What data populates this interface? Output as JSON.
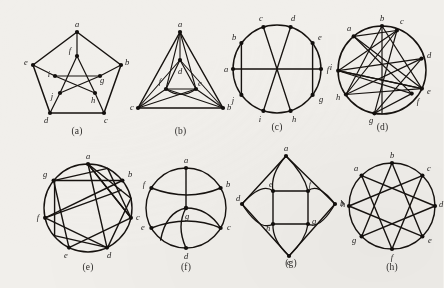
{
  "figure": {
    "background_color": "#f1efeb",
    "ink_color": "#16120f",
    "panel_count": 8
  },
  "captions": {
    "a": "(a)",
    "b": "(b)",
    "c": "(c)",
    "d": "(d)",
    "e": "(e)",
    "f": "(f)",
    "g": "(g)",
    "h": "(h)"
  },
  "panels": [
    {
      "id": "a",
      "caption": "(a)",
      "layout": "pentagon-with-inner-pentagram",
      "vertex_labels": [
        "a",
        "b",
        "c",
        "d",
        "e",
        "f",
        "g",
        "h",
        "i",
        "j"
      ],
      "outer_labels": [
        "a",
        "b",
        "c",
        "d",
        "e"
      ],
      "inner_labels": [
        "f",
        "g",
        "h",
        "i",
        "j"
      ],
      "labels": {
        "a": "a",
        "b": "b",
        "c": "c",
        "d": "d",
        "e": "e",
        "f": "f",
        "g": "g",
        "h": "h",
        "i": "i",
        "j": "j"
      }
    },
    {
      "id": "b",
      "caption": "(b)",
      "layout": "triangle-with-nested-triangle",
      "vertex_labels": [
        "a",
        "b",
        "c",
        "d",
        "e",
        "f"
      ],
      "labels": {
        "a": "a",
        "b": "b",
        "c": "c",
        "d": "d",
        "e": "e",
        "f": "f"
      }
    },
    {
      "id": "c",
      "caption": "(c)",
      "layout": "circle-10-with-chords",
      "vertex_labels": [
        "a",
        "b",
        "c",
        "d",
        "e",
        "f",
        "g",
        "h",
        "i",
        "j"
      ],
      "chords": [
        [
          "a",
          "f"
        ],
        [
          "b",
          "j"
        ],
        [
          "e",
          "g"
        ],
        [
          "c",
          "h"
        ],
        [
          "d",
          "i"
        ]
      ],
      "labels": {
        "a": "a",
        "b": "b",
        "c": "c",
        "d": "d",
        "e": "e",
        "f": "f",
        "g": "g",
        "h": "h",
        "i": "i",
        "j": "j"
      }
    },
    {
      "id": "d",
      "caption": "(d)",
      "layout": "circle-9-dense-chords",
      "vertex_labels": [
        "a",
        "b",
        "c",
        "d",
        "e",
        "f",
        "g",
        "h",
        "i"
      ],
      "labels": {
        "a": "a",
        "b": "b",
        "c": "c",
        "d": "d",
        "e": "e",
        "f": "f",
        "g": "g",
        "h": "h",
        "i": "i"
      }
    },
    {
      "id": "e",
      "caption": "(e)",
      "layout": "circle-7-star-polygon",
      "vertex_labels": [
        "a",
        "b",
        "c",
        "d",
        "e",
        "f",
        "g"
      ],
      "star_step": 2,
      "labels": {
        "a": "a",
        "b": "b",
        "c": "c",
        "d": "d",
        "e": "e",
        "f": "f",
        "g": "g"
      }
    },
    {
      "id": "f",
      "caption": "(f)",
      "layout": "circle-6-with-center-hub",
      "vertex_labels": [
        "a",
        "b",
        "c",
        "d",
        "e",
        "f",
        "g"
      ],
      "center_label": "g",
      "labels": {
        "a": "a",
        "b": "b",
        "c": "c",
        "d": "d",
        "e": "e",
        "f": "f",
        "g": "g"
      }
    },
    {
      "id": "g",
      "caption": "(g)",
      "layout": "diamond-with-inner-square",
      "vertex_labels": [
        "a",
        "b",
        "c",
        "d",
        "e",
        "f",
        "g",
        "h"
      ],
      "outer_labels": [
        "a",
        "b",
        "c",
        "d"
      ],
      "inner_labels": [
        "e",
        "f",
        "g",
        "h"
      ],
      "labels": {
        "a": "a",
        "b": "b",
        "c": "c",
        "d": "d",
        "e": "e",
        "f": "f",
        "g": "g",
        "h": "h"
      }
    },
    {
      "id": "h",
      "caption": "(h)",
      "layout": "circle-8-star-polygon",
      "vertex_labels": [
        "a",
        "b",
        "c",
        "d",
        "e",
        "f",
        "g",
        "h"
      ],
      "star_step": 3,
      "labels": {
        "a": "a",
        "b": "b",
        "c": "c",
        "d": "d",
        "e": "e",
        "f": "f",
        "g": "g",
        "h": "h"
      }
    }
  ]
}
